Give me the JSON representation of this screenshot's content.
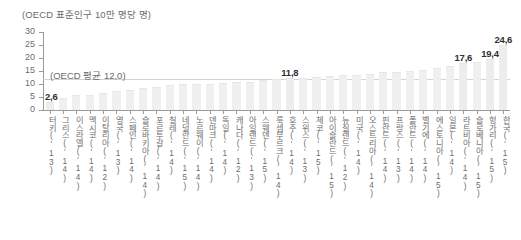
{
  "caption": "(OECD 표준인구 10만 명당 명)",
  "average_note": "(OECD 평균 12,0)",
  "axis": {
    "y_ticks": [
      "30",
      "25",
      "20",
      "15",
      "10",
      "5",
      "0"
    ],
    "y_min": 0,
    "y_max": 30
  },
  "chart_data": {
    "type": "bar",
    "title": "",
    "subtitle": "",
    "xlabel": "",
    "ylabel": "(OECD 표준인구 10만 명당 명)",
    "ylim": [
      0,
      30
    ],
    "ytick_values": [
      0,
      5,
      10,
      15,
      20,
      25,
      30
    ],
    "grid": false,
    "legend": "none",
    "reference_line": {
      "label": "(OECD 평균 12,0)",
      "value": 12.0
    },
    "bar_color": "#f0f0f0",
    "label_color": "#2f2f2f",
    "categories": [
      "터키('13)",
      "그리스('14)",
      "이스라엘('14)",
      "멕시코('14)",
      "이탈리아('12)",
      "영국('13)",
      "스페인('14)",
      "슬로바키아('14)",
      "포르투갈('14)",
      "칠레('14)",
      "네덜란드('15)",
      "노르웨이('14)",
      "덴마크('14)",
      "독일('14)",
      "캐나다('12)",
      "아일랜드('13)",
      "스웨덴('15)",
      "룩셈부르크('14)",
      "호주('14)",
      "스위스('13)",
      "체코('15)",
      "아이슬란드('15)",
      "뉴질랜드('12)",
      "미국('14)",
      "오스트리아('14)",
      "핀란드('14)",
      "프랑스('13)",
      "폴란드('14)",
      "벨기에('14)",
      "에스토니아('15)",
      "일본('14)",
      "라트비아('14)",
      "슬로베니아('15)",
      "헝가리('15)",
      "한국('15)"
    ],
    "values": [
      2.6,
      4.4,
      5.4,
      5.5,
      6.3,
      7.0,
      7.3,
      8.0,
      8.6,
      9.3,
      9.5,
      9.6,
      9.7,
      10.0,
      10.4,
      10.5,
      11.1,
      11.5,
      11.8,
      12.0,
      12.4,
      12.7,
      12.9,
      13.1,
      13.5,
      14.1,
      14.4,
      14.5,
      15.0,
      15.7,
      16.6,
      17.6,
      18.1,
      19.4,
      24.6
    ],
    "value_labels": [
      {
        "category": "터키('13)",
        "text": "2,6"
      },
      {
        "category": "호주('14)",
        "text": "11,8"
      },
      {
        "category": "라트비아('14)",
        "text": "17,6"
      },
      {
        "category": "헝가리('15)",
        "text": "19,4"
      },
      {
        "category": "한국('15)",
        "text": "24,6"
      }
    ]
  }
}
